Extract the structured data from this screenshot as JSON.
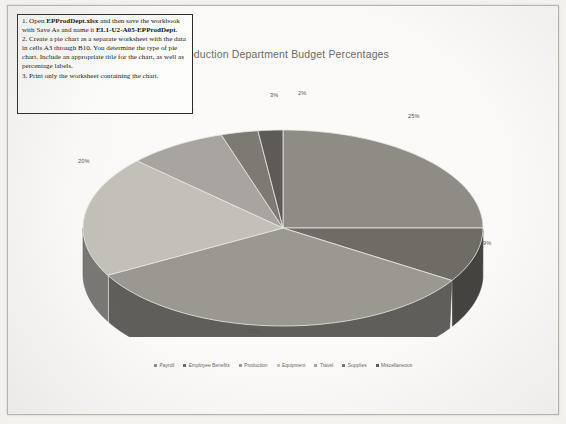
{
  "document": {
    "kind": "scanned-worksheet-page"
  },
  "instructions": {
    "steps": [
      {
        "number": "1.",
        "segments": [
          {
            "text": "Open ",
            "bold": false
          },
          {
            "text": "EPProdDept.xlsx",
            "bold": true
          },
          {
            "text": " and then save the workbook with Save As and name it ",
            "bold": false
          },
          {
            "text": "EL1-U2-A05-EPProdDept",
            "bold": true
          },
          {
            "text": ".",
            "bold": false
          }
        ]
      },
      {
        "number": "2.",
        "segments": [
          {
            "text": "Create a pie chart as a separate worksheet with the data in cells A3 through B10. You determine the type of pie chart. Include an appropriate title for the chart, as well as percentage labels.",
            "bold": false
          }
        ]
      },
      {
        "number": "3.",
        "segments": [
          {
            "text": "Print only the worksheet containing the chart.",
            "bold": false
          }
        ]
      }
    ]
  },
  "chart_data": {
    "type": "pie",
    "title": "Production Department Budget Percentages",
    "xlabel": "",
    "ylabel": "",
    "three_d": true,
    "legend_position": "bottom",
    "grid": false,
    "categories": [
      "Payroll",
      "Employee Benefits",
      "Production",
      "Equipment",
      "Travel",
      "Supplies",
      "Miscellaneous"
    ],
    "values": [
      25,
      9,
      33,
      20,
      8,
      3,
      2
    ],
    "data_labels": [
      "25%",
      "9%",
      "33%",
      "20%",
      "8%",
      "3%",
      "2%"
    ],
    "colors": [
      "#8f8c86",
      "#6f6c66",
      "#9b9892",
      "#c3c0ba",
      "#a8a5a0",
      "#7d7a74",
      "#5e5b56"
    ]
  },
  "labels": {
    "p25": "25%",
    "p9": "9%",
    "p33": "33%",
    "p20": "20%",
    "p8": "8%",
    "p3": "3%",
    "p2": "2%"
  }
}
